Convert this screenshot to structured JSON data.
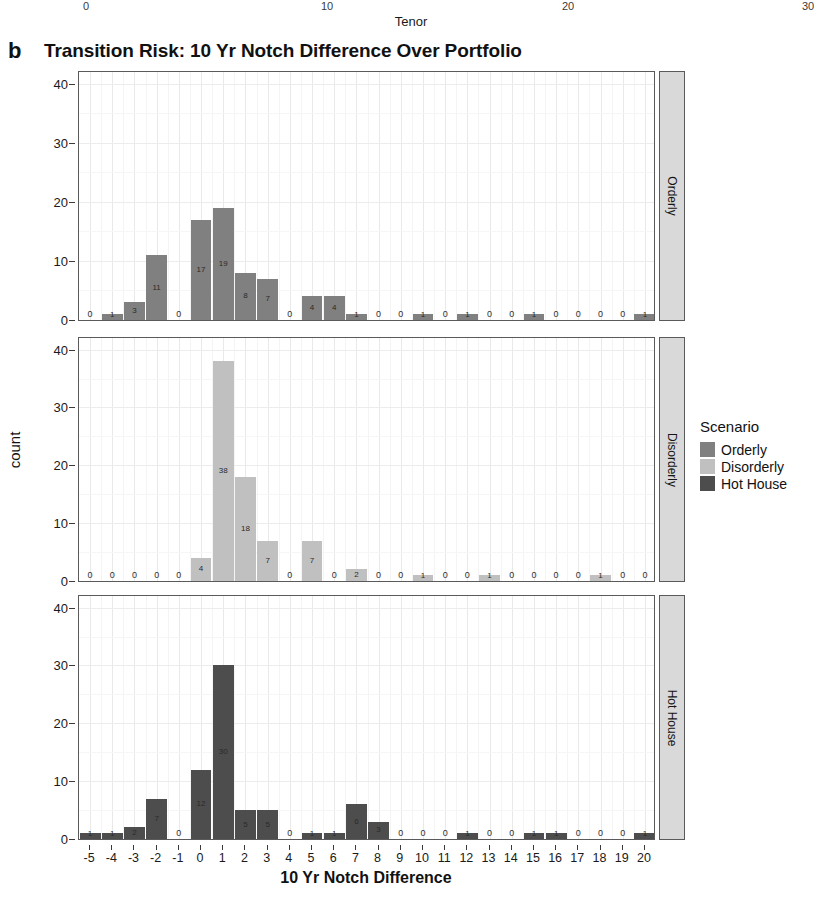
{
  "top_axis": {
    "label": "Tenor",
    "ticks": [
      "0",
      "10",
      "20",
      "30"
    ],
    "tick_values": [
      0,
      10,
      20,
      30
    ]
  },
  "panel_letter": "b",
  "title": "Transition Risk: 10 Yr Notch Difference Over Portfolio",
  "legend": {
    "title": "Scenario",
    "items": [
      {
        "label": "Orderly",
        "color": "#808080"
      },
      {
        "label": "Disorderly",
        "color": "#c0c0c0"
      },
      {
        "label": "Hot House",
        "color": "#4d4d4d"
      }
    ]
  },
  "strips": [
    "Orderly",
    "Disorderly",
    "Hot House"
  ],
  "axes": {
    "ylabel": "count",
    "xlabel": "10 Yr Notch Difference",
    "yticks": [
      "0",
      "10",
      "20",
      "30",
      "40"
    ],
    "ytick_values": [
      0,
      10,
      20,
      30,
      40
    ],
    "ylim": [
      0,
      42
    ],
    "xticks": [
      "-5",
      "-4",
      "-3",
      "-2",
      "-1",
      "0",
      "1",
      "2",
      "3",
      "4",
      "5",
      "6",
      "7",
      "8",
      "9",
      "10",
      "11",
      "12",
      "13",
      "14",
      "15",
      "16",
      "17",
      "18",
      "19",
      "20"
    ]
  },
  "chart_data": {
    "type": "bar",
    "title": "Transition Risk: 10 Yr Notch Difference Over Portfolio",
    "xlabel": "10 Yr Notch Difference",
    "ylabel": "count",
    "ylim": [
      0,
      42
    ],
    "grid": true,
    "legend_position": "right",
    "legend_title": "Scenario",
    "facet_variable": "Scenario",
    "categories": [
      -5,
      -4,
      -3,
      -2,
      -1,
      0,
      1,
      2,
      3,
      4,
      5,
      6,
      7,
      8,
      9,
      10,
      11,
      12,
      13,
      14,
      15,
      16,
      17,
      18,
      19,
      20
    ],
    "series": [
      {
        "name": "Orderly",
        "color": "#808080",
        "values": [
          0,
          1,
          3,
          11,
          0,
          17,
          19,
          8,
          7,
          0,
          4,
          4,
          1,
          0,
          0,
          1,
          0,
          1,
          0,
          0,
          1,
          0,
          0,
          0,
          0,
          1
        ]
      },
      {
        "name": "Disorderly",
        "color": "#c0c0c0",
        "values": [
          0,
          0,
          0,
          0,
          0,
          4,
          38,
          18,
          7,
          0,
          7,
          0,
          2,
          0,
          0,
          1,
          0,
          0,
          1,
          0,
          0,
          0,
          0,
          1,
          0,
          0
        ]
      },
      {
        "name": "Hot House",
        "color": "#4d4d4d",
        "values": [
          1,
          1,
          2,
          7,
          0,
          12,
          30,
          5,
          5,
          0,
          1,
          1,
          6,
          3,
          0,
          0,
          0,
          1,
          0,
          0,
          1,
          1,
          0,
          0,
          0,
          1
        ]
      }
    ]
  }
}
